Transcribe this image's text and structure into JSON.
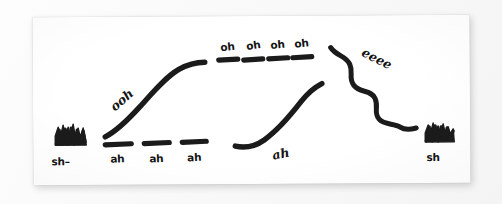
{
  "canvas": {
    "paper_color": "#ffffff",
    "background_color": "#fafafa",
    "ink_color": "#1b1b1b"
  },
  "score": {
    "marks": [
      {
        "name": "sh-onset-scribble",
        "glyph": "dense-scribble-block",
        "label": "sh–"
      },
      {
        "name": "ooh-rising-glide",
        "glyph": "rising-s-curve",
        "label": "ooh"
      },
      {
        "name": "ah-sustained-tones",
        "glyph": "level-dashes",
        "labels": [
          "ah",
          "ah",
          "ah"
        ]
      },
      {
        "name": "oh-sustained-tones",
        "glyph": "level-dashes-high",
        "labels": [
          "oh",
          "oh",
          "oh",
          "oh"
        ]
      },
      {
        "name": "ah-rising-glide",
        "glyph": "rising-curve",
        "label": "ah"
      },
      {
        "name": "eeee-descending-wave",
        "glyph": "wavy-descending-line",
        "label": "eeee"
      },
      {
        "name": "sh-ending-scribble",
        "glyph": "dense-scribble-block",
        "label": "sh"
      }
    ]
  }
}
